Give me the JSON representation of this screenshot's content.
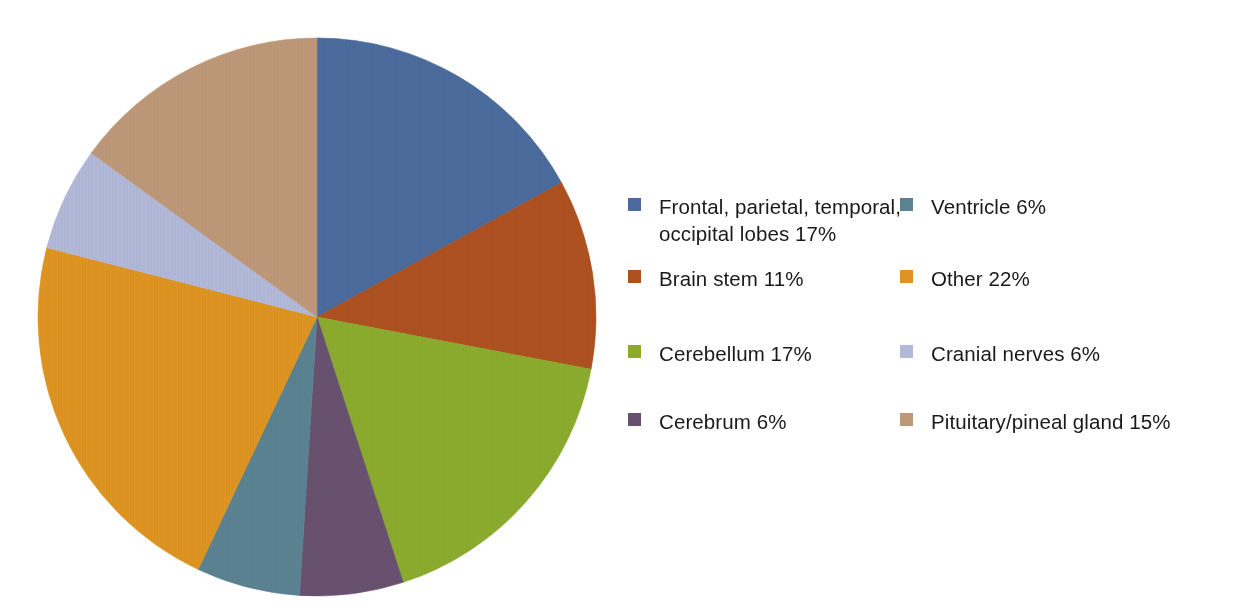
{
  "chart_data": {
    "type": "pie",
    "title": "",
    "subtitle": "",
    "xlabel": "",
    "ylabel": "",
    "grid": false,
    "legend_position": "right",
    "legend_columns": 2,
    "start_angle_deg": 0,
    "direction": "clockwise",
    "units": "percent",
    "total": 100,
    "categories": [
      "Frontal, parietal, temporal, occipital lobes",
      "Brain stem",
      "Cerebellum",
      "Cerebrum",
      "Ventricle",
      "Other",
      "Cranial nerves",
      "Pituitary/pineal gland"
    ],
    "values": [
      17,
      11,
      17,
      6,
      6,
      22,
      6,
      15
    ],
    "value_labels": [
      "17%",
      "11%",
      "17%",
      "6%",
      "6%",
      "22%",
      "6%",
      "15%"
    ],
    "colors": [
      "#4a6b9c",
      "#ae5120",
      "#8aab2e",
      "#68516f",
      "#5b8290",
      "#dd9420",
      "#b1b8d8",
      "#bd9878"
    ],
    "slices": [
      {
        "label": "Frontal, parietal, temporal, occipital lobes",
        "value": 17,
        "value_label": "17%",
        "color": "#4a6b9c",
        "order": 1
      },
      {
        "label": "Brain stem",
        "value": 11,
        "value_label": "11%",
        "color": "#ae5120",
        "order": 2
      },
      {
        "label": "Cerebellum",
        "value": 17,
        "value_label": "17%",
        "color": "#8aab2e",
        "order": 3
      },
      {
        "label": "Cerebrum",
        "value": 6,
        "value_label": "6%",
        "color": "#68516f",
        "order": 4
      },
      {
        "label": "Ventricle",
        "value": 6,
        "value_label": "6%",
        "color": "#5b8290",
        "order": 5
      },
      {
        "label": "Other",
        "value": 22,
        "value_label": "22%",
        "color": "#dd9420",
        "order": 6
      },
      {
        "label": "Cranial nerves",
        "value": 6,
        "value_label": "6%",
        "color": "#b1b8d8",
        "order": 7
      },
      {
        "label": "Pituitary/pineal gland",
        "value": 15,
        "value_label": "15%",
        "color": "#bd9878",
        "order": 8
      }
    ]
  },
  "legend": {
    "columns": [
      {
        "name": "left-column",
        "items": [
          {
            "text": "Frontal, parietal, temporal,\noccipital lobes 17%",
            "color": "#4a6b9c",
            "swatch_name": "legend-swatch-lobes"
          },
          {
            "text": "Brain stem 11%",
            "color": "#ae5120",
            "swatch_name": "legend-swatch-brain-stem"
          },
          {
            "text": "Cerebellum 17%",
            "color": "#8aab2e",
            "swatch_name": "legend-swatch-cerebellum"
          },
          {
            "text": "Cerebrum 6%",
            "color": "#68516f",
            "swatch_name": "legend-swatch-cerebrum"
          }
        ]
      },
      {
        "name": "right-column",
        "items": [
          {
            "text": "Ventricle 6%",
            "color": "#5b8290",
            "swatch_name": "legend-swatch-ventricle"
          },
          {
            "text": "Other 22%",
            "color": "#dd9420",
            "swatch_name": "legend-swatch-other"
          },
          {
            "text": "Cranial nerves 6%",
            "color": "#b1b8d8",
            "swatch_name": "legend-swatch-cranial-nerves"
          },
          {
            "text": "Pituitary/pineal gland 15%",
            "color": "#bd9878",
            "swatch_name": "legend-swatch-pituitary"
          }
        ]
      }
    ]
  },
  "canvas": {
    "background": "#ffffff",
    "pie_center_x": 317,
    "pie_center_y": 317,
    "pie_radius": 280
  }
}
